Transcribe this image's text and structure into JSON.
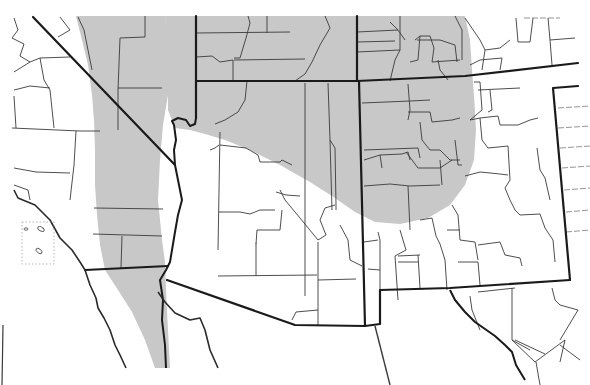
{
  "map": {
    "type": "species-distribution-range-map",
    "region": "Southwestern United States (Four Corners region)",
    "states_depicted": [
      "California",
      "Nevada",
      "Utah",
      "Colorado",
      "Arizona",
      "New Mexico",
      "Baja California",
      "Sonora",
      "Chihuahua"
    ],
    "background_color": "#ffffff",
    "boundary_color": "#1a1a1a",
    "range_fill_color": "#c8c8c8",
    "range_regions": [
      {
        "id": "western-band",
        "description": "North-south band through eastern California / western Nevada continuing south along Colorado River into Baja California"
      },
      {
        "id": "northeastern-region",
        "description": "Southern Utah, northern Arizona plateau and southwestern Colorado extending to northwestern New Mexico"
      }
    ],
    "labels": []
  }
}
